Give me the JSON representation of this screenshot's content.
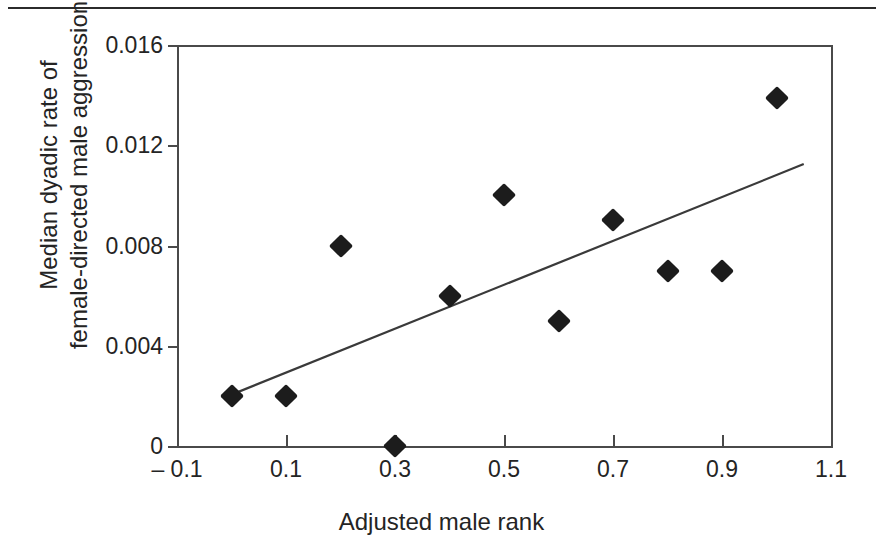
{
  "figure": {
    "top_rule": "horizontal-rule"
  },
  "chart_data": {
    "type": "scatter",
    "title": "",
    "xlabel": "Adjusted male rank",
    "ylabel": "Median dyadic rate of female-directed male aggression",
    "ylabel_line1": "Median dyadic rate of",
    "ylabel_line2": "female-directed male aggression",
    "xlim": [
      -0.1,
      1.1
    ],
    "ylim": [
      0,
      0.016
    ],
    "xticks": [
      -0.1,
      0.1,
      0.3,
      0.5,
      0.7,
      0.9,
      1.1
    ],
    "xticklabels": [
      "– 0.1",
      "0.1",
      "0.3",
      "0.5",
      "0.7",
      "0.9",
      "1.1"
    ],
    "yticks": [
      0,
      0.004,
      0.008,
      0.012,
      0.016
    ],
    "yticklabels": [
      "0",
      "0.004",
      "0.008",
      "0.012",
      "0.016"
    ],
    "grid": false,
    "legend": false,
    "marker": "diamond",
    "marker_color": "#1c1c1c",
    "x": [
      0.0,
      0.1,
      0.2,
      0.3,
      0.4,
      0.5,
      0.6,
      0.7,
      0.8,
      0.9,
      1.0
    ],
    "y": [
      0.002,
      0.002,
      0.008,
      0.0,
      0.006,
      0.01,
      0.005,
      0.009,
      0.007,
      0.007,
      0.0139
    ],
    "points": [
      {
        "x": 0.0,
        "y": 0.002
      },
      {
        "x": 0.1,
        "y": 0.002
      },
      {
        "x": 0.2,
        "y": 0.008
      },
      {
        "x": 0.3,
        "y": 0.0
      },
      {
        "x": 0.4,
        "y": 0.006
      },
      {
        "x": 0.5,
        "y": 0.01
      },
      {
        "x": 0.6,
        "y": 0.005
      },
      {
        "x": 0.7,
        "y": 0.009
      },
      {
        "x": 0.8,
        "y": 0.007
      },
      {
        "x": 0.9,
        "y": 0.007
      },
      {
        "x": 1.0,
        "y": 0.0139
      }
    ],
    "trendline": {
      "type": "line",
      "color": "#3a3a3a",
      "x0": 0.0,
      "y0": 0.00205,
      "x1": 1.05,
      "y1": 0.01125
    }
  }
}
